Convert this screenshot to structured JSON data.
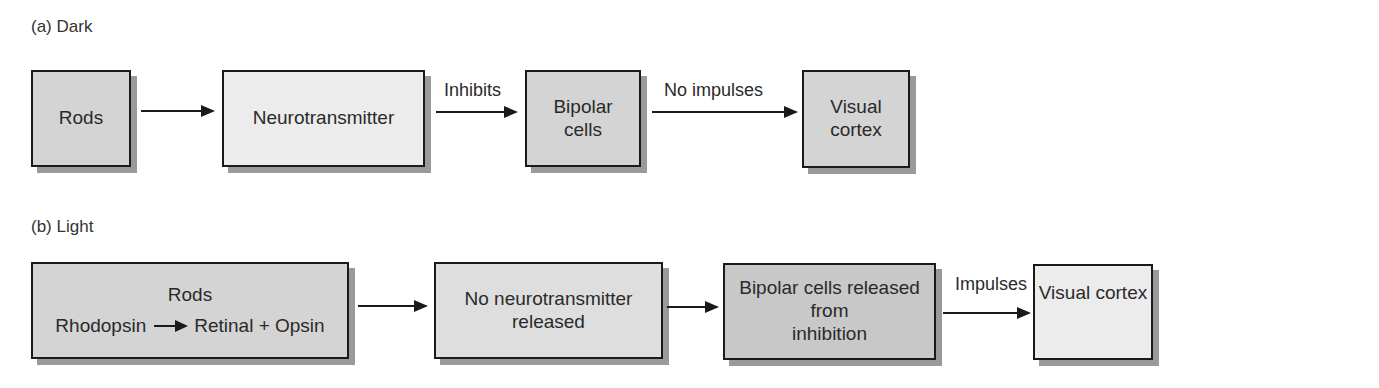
{
  "panel_a": {
    "label": "(a)  Dark",
    "boxes": [
      {
        "id": "rods",
        "text": "Rods"
      },
      {
        "id": "neurotransmitter",
        "text": "Neurotransmitter"
      },
      {
        "id": "bipolar",
        "line1": "Bipolar",
        "line2": "cells"
      },
      {
        "id": "visual_cortex",
        "line1": "Visual",
        "line2": "cortex"
      }
    ],
    "arrows": [
      {
        "label": ""
      },
      {
        "label": "Inhibits"
      },
      {
        "label": "No impulses"
      }
    ]
  },
  "panel_b": {
    "label": "(b)  Light",
    "boxes": [
      {
        "id": "rods",
        "title": "Rods",
        "reactant": "Rhodopsin",
        "products": "Retinal + Opsin"
      },
      {
        "id": "no_neurotransmitter",
        "line1": "No neurotransmitter",
        "line2": "released"
      },
      {
        "id": "bipolar_released",
        "line1": "Bipolar cells released from",
        "line2": "inhibition"
      },
      {
        "id": "visual_cortex",
        "text": "Visual cortex"
      }
    ],
    "arrows": [
      {
        "label": ""
      },
      {
        "label": ""
      },
      {
        "label": "Impulses"
      }
    ]
  }
}
